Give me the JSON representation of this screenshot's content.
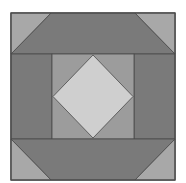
{
  "diagram": {
    "type": "quilt-block",
    "colors": {
      "background": "#ffffff",
      "dark": "#7a7a7a",
      "medium": "#9c9c9c",
      "light": "#cfcfcf",
      "corner": "#a8a8a8",
      "stroke": "#4a4a4a"
    }
  }
}
